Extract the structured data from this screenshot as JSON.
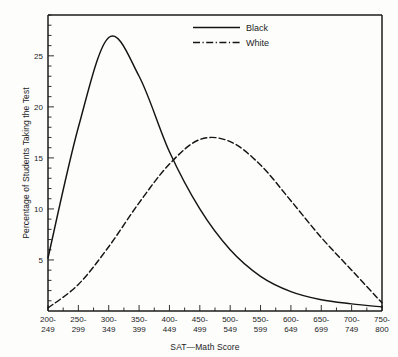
{
  "chart_data": {
    "type": "line",
    "title": "",
    "xlabel": "SAT—Math Score",
    "ylabel": "Percentage of Students Taking the Test",
    "grid": false,
    "legend_position": "top-center",
    "categories": [
      "200-249",
      "250-299",
      "300-349",
      "350-399",
      "400-449",
      "450-499",
      "500-549",
      "550-599",
      "600-649",
      "650-699",
      "700-749",
      "750-800"
    ],
    "xtick_labels_line1": [
      "200-",
      "250-",
      "300-",
      "350-",
      "400-",
      "450-",
      "500-",
      "550-",
      "600-",
      "650-",
      "700-",
      "750-"
    ],
    "xtick_labels_line2": [
      "249",
      "299",
      "349",
      "399",
      "449",
      "499",
      "549",
      "599",
      "649",
      "699",
      "749",
      "800"
    ],
    "ytick_labels": [
      "5",
      "10",
      "15",
      "20",
      "25"
    ],
    "ytick_values": [
      5,
      10,
      15,
      20,
      25
    ],
    "ylim": [
      0,
      29
    ],
    "xlim": [
      0,
      11
    ],
    "series": [
      {
        "name": "Black",
        "style": "solid",
        "values": [
          5.2,
          18.0,
          26.8,
          23.0,
          15.6,
          10.0,
          6.0,
          3.4,
          1.9,
          1.1,
          0.7,
          0.4
        ]
      },
      {
        "name": "White",
        "style": "dashed",
        "values": [
          0.3,
          2.6,
          6.3,
          10.6,
          14.4,
          16.8,
          16.6,
          14.3,
          10.8,
          7.2,
          4.0,
          0.8
        ]
      }
    ]
  },
  "legend": {
    "items": [
      {
        "label": "Black",
        "style": "solid"
      },
      {
        "label": "White",
        "style": "dash-dot"
      }
    ]
  },
  "axes": {
    "x_title": "SAT—Math Score",
    "y_title": "Percentage of Students Taking the Test"
  }
}
